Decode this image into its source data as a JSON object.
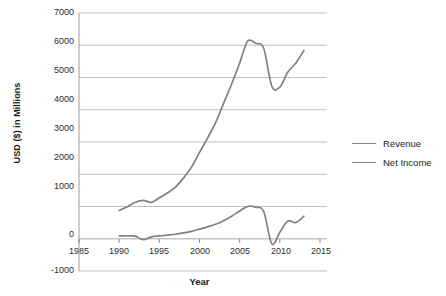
{
  "chart_data": {
    "type": "line",
    "title": "",
    "xlabel": "Year",
    "ylabel": "USD ($) in Millions",
    "xlim": [
      1985,
      2015
    ],
    "ylim": [
      -1000,
      7000
    ],
    "xticks": [
      1985,
      1990,
      1995,
      2000,
      2005,
      2010,
      2015
    ],
    "yticks": [
      -1000,
      0,
      1000,
      2000,
      3000,
      4000,
      5000,
      6000,
      7000
    ],
    "grid": "horizontal",
    "legend_position": "right",
    "x": [
      1990,
      1991,
      1992,
      1993,
      1994,
      1995,
      1996,
      1997,
      1998,
      1999,
      2000,
      2001,
      2002,
      2003,
      2004,
      2005,
      2006,
      2007,
      2008,
      2009,
      2010,
      2011,
      2012,
      2013
    ],
    "series": [
      {
        "name": "Revenue",
        "color": "#808080",
        "values": [
          880,
          990,
          1130,
          1190,
          1130,
          1270,
          1420,
          1600,
          1880,
          2220,
          2680,
          3120,
          3600,
          4200,
          4800,
          5450,
          6130,
          6060,
          5900,
          4730,
          4700,
          5170,
          5450,
          5840
        ]
      },
      {
        "name": "Net Income",
        "color": "#808080",
        "values": [
          90,
          85,
          80,
          -30,
          60,
          90,
          110,
          140,
          180,
          230,
          300,
          370,
          450,
          560,
          700,
          860,
          1000,
          980,
          840,
          -160,
          200,
          550,
          500,
          700
        ]
      }
    ],
    "annotations": []
  },
  "legend": {
    "items": [
      {
        "label": "Revenue"
      },
      {
        "label": "Net Income"
      }
    ]
  },
  "axes": {
    "y_title": "USD ($) in Millions",
    "x_title": "Year",
    "y_tick_labels": [
      "7000",
      "6000",
      "5000",
      "4000",
      "3000",
      "2000",
      "1000",
      "0",
      "-1000"
    ],
    "x_tick_labels": [
      "1985",
      "1990",
      "1995",
      "2000",
      "2005",
      "2010",
      "2015"
    ]
  },
  "colors": {
    "line": "#808080",
    "grid": "#bfbfbf",
    "axis": "#7f7f7f",
    "text": "#1a1a1a"
  }
}
